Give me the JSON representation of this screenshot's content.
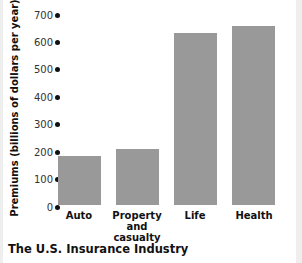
{
  "chart_data": {
    "type": "bar",
    "title": "The U.S. Insurance Industry",
    "xlabel": "",
    "ylabel": "Premiums (billions of dollars per year)",
    "categories": [
      "Auto",
      "Property and casualty",
      "Life",
      "Health"
    ],
    "category_display": [
      "Auto",
      "Property\nand casualty",
      "Life",
      "Health"
    ],
    "values": [
      185,
      210,
      635,
      660
    ],
    "ylim": [
      0,
      700
    ],
    "yticks": [
      0,
      100,
      200,
      300,
      400,
      500,
      600,
      700
    ],
    "grid": false,
    "legend": null,
    "bar_color": "#999999"
  },
  "labels": {
    "title": "The U.S. Insurance Industry",
    "ylabel": "Premiums (billions of dollars per year)",
    "x": [
      "Auto",
      "Property",
      "and casualty",
      "Life",
      "Health"
    ]
  }
}
